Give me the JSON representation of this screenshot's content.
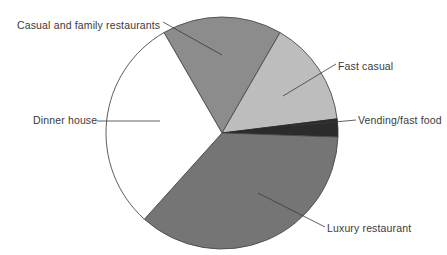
{
  "chart_data": {
    "type": "pie",
    "title": "",
    "subtitle": "",
    "xlabel": "",
    "ylabel": "",
    "grid": false,
    "legend_position": "callout-labels",
    "center": {
      "x": 222,
      "y": 133
    },
    "radius": 116,
    "start_angle_deg": 330,
    "direction": "clockwise",
    "categories": [
      "Casual and family restaurants",
      "Fast casual",
      "Vending/fast food",
      "Luxury restaurant",
      "Dinner house"
    ],
    "values": [
      16.7,
      14.7,
      2.5,
      36.1,
      30.0
    ],
    "slices": [
      {
        "label": "Casual and family restaurants",
        "value": 16.7,
        "start_deg": 330,
        "end_deg": 390,
        "color": "#8c8c8c",
        "stroke": "#4a4a4a"
      },
      {
        "label": "Fast casual",
        "value": 14.7,
        "start_deg": 390,
        "end_deg": 443,
        "color": "#bdbdbd",
        "stroke": "#4a4a4a"
      },
      {
        "label": "Vending/fast food",
        "value": 2.5,
        "start_deg": 443,
        "end_deg": 452,
        "color": "#2b2b2b",
        "stroke": "#2b2b2b"
      },
      {
        "label": "Luxury restaurant",
        "value": 36.1,
        "start_deg": 452,
        "end_deg": 582,
        "color": "#757575",
        "stroke": "#4a4a4a"
      },
      {
        "label": "Dinner house",
        "value": 30.0,
        "start_deg": 582,
        "end_deg": 690,
        "color": "#ffffff",
        "stroke": "#4a4a4a"
      }
    ],
    "leader_lines": [
      {
        "for": "Casual and family restaurants",
        "x1": 163,
        "y1": 22,
        "x2": 222,
        "y2": 55
      },
      {
        "for": "Fast casual",
        "x1": 336,
        "y1": 64,
        "x2": 283,
        "y2": 96
      },
      {
        "for": "Vending/fast food",
        "x1": 356,
        "y1": 120,
        "x2": 292,
        "y2": 126
      },
      {
        "for": "Luxury restaurant",
        "x1": 325,
        "y1": 227,
        "x2": 258,
        "y2": 193
      },
      {
        "for": "Dinner house",
        "x1": 97,
        "y1": 121,
        "x2": 160,
        "y2": 121
      }
    ]
  },
  "labels": {
    "casual_family": "Casual and family restaurants",
    "fast_casual": "Fast casual",
    "vending_fast_food": "Vending/fast food",
    "luxury_restaurant": "Luxury restaurant",
    "dinner_house": "Dinner house"
  },
  "colors": {
    "casual_family": "#8c8c8c",
    "fast_casual": "#bdbdbd",
    "vending_fast_food": "#2b2b2b",
    "luxury_restaurant": "#757575",
    "dinner_house": "#ffffff",
    "outline": "#4a4a4a",
    "text": "#3a3a3a",
    "background": "#ffffff"
  }
}
